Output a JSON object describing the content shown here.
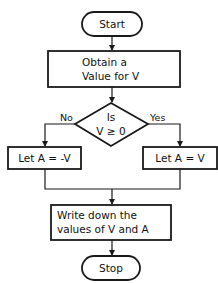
{
  "diagram": {
    "type": "flowchart",
    "nodes": {
      "start": {
        "shape": "terminator",
        "label": "Start"
      },
      "obtain": {
        "shape": "process",
        "line1": "Obtain a",
        "line2": "Value for V"
      },
      "decision": {
        "shape": "decision",
        "line1": "Is",
        "line2": "V ≥ 0"
      },
      "neg": {
        "shape": "process",
        "label": "Let A = -V"
      },
      "pos": {
        "shape": "process",
        "label": "Let A = V"
      },
      "write": {
        "shape": "process",
        "line1": "Write down the",
        "line2": "values of V and A"
      },
      "stop": {
        "shape": "terminator",
        "label": "Stop"
      }
    },
    "edges": {
      "no_label": "No",
      "yes_label": "Yes"
    },
    "colors": {
      "stroke": "#1a1a1a",
      "fill": "#ffffff"
    }
  }
}
